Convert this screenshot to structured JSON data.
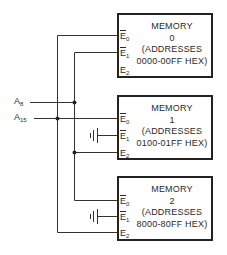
{
  "memories": [
    {
      "title": "MEMORY",
      "index": "0",
      "line1": "(ADDRESSES",
      "line2": "0000-00FF HEX)"
    },
    {
      "title": "MEMORY",
      "index": "1",
      "line1": "(ADDRESSES",
      "line2": "0100-01FF HEX)"
    },
    {
      "title": "MEMORY",
      "index": "2",
      "line1": "(ADDRESSES",
      "line2": "8000-80FF HEX)"
    }
  ],
  "pins": {
    "e0": {
      "letter": "E",
      "sub": "0"
    },
    "e1": {
      "letter": "E",
      "sub": "1"
    },
    "e2": {
      "letter": "E",
      "sub": "2"
    }
  },
  "signals": {
    "a8": {
      "letter": "A",
      "sub": "8"
    },
    "a15": {
      "letter": "A",
      "sub": "15"
    }
  }
}
